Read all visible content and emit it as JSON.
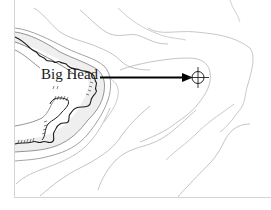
{
  "map": {
    "place_label": "Big Head",
    "features": {
      "coastline": "rocky-shore",
      "marker": "crosshair-target",
      "arrow": "pointer-arrow"
    },
    "colors": {
      "background": "#ffffff",
      "contour_light": "#b8b8b8",
      "contour_dark": "#555555",
      "coastline": "#222222",
      "shallow_fill": "#ececec",
      "arrow": "#000000",
      "frame": "#d0d0d0"
    }
  }
}
